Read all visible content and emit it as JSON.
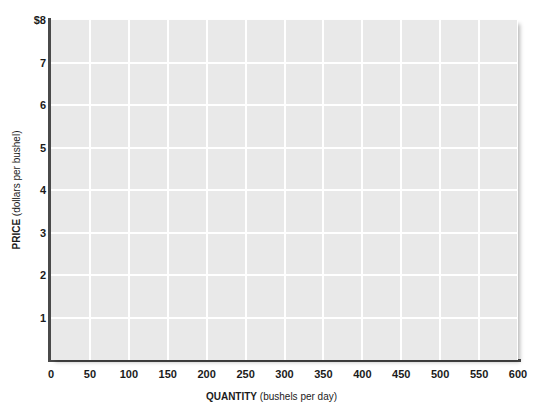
{
  "chart_data": {
    "type": "line",
    "title": "",
    "subtitle": "",
    "xlabel_bold": "QUANTITY",
    "xlabel_note": "(bushels per day)",
    "ylabel_bold": "PRICE",
    "ylabel_note": "(dollars per bushel)",
    "xlim": [
      0,
      600
    ],
    "ylim": [
      0,
      8
    ],
    "x_ticks": [
      0,
      50,
      100,
      150,
      200,
      250,
      300,
      350,
      400,
      450,
      500,
      550,
      600
    ],
    "x_tick_labels": [
      "0",
      "50",
      "100",
      "150",
      "200",
      "250",
      "300",
      "350",
      "400",
      "450",
      "500",
      "550",
      "600"
    ],
    "y_ticks": [
      1,
      2,
      3,
      4,
      5,
      6,
      7,
      8
    ],
    "y_tick_labels": [
      "1",
      "2",
      "3",
      "4",
      "5",
      "6",
      "7",
      "$8"
    ],
    "grid": true,
    "grid_x_step": 50,
    "grid_y_step": 1,
    "legend": null,
    "series": [],
    "annotations": [],
    "plot_background": "#e9e9e9",
    "grid_color": "#ffffff",
    "axis_color": "#4a4a4a",
    "page_background": "#ffffff"
  }
}
